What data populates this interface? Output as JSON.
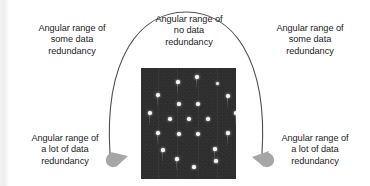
{
  "figure": {
    "background_color": "#ffffff",
    "text_color": "#1b1b1b",
    "arrow_color": "#a6a6a6",
    "arc_color": "#4f4f4f",
    "image_background": "#2b2b2b"
  },
  "captions": {
    "top_left": "Angular range of\nsome data\nredundancy",
    "top_middle": "Angular range of\nno data\nredundancy",
    "top_right": "Angular range of\nsome data\nredundancy",
    "bottom_left": "Angular range of\na lot of data\nredundancy",
    "bottom_right": "Angular range of\na lot of data\nredundancy"
  },
  "arc": {
    "label": "semicircular-scan-arc",
    "left_endpoint": [
      108,
      152
    ],
    "apex": [
      185,
      12
    ],
    "right_endpoint": [
      263,
      152
    ]
  },
  "arrows": {
    "left": {
      "label": "left-arrowhead",
      "x": 112,
      "y": 155
    },
    "right": {
      "label": "right-arrowhead",
      "x": 266,
      "y": 155
    }
  },
  "sinogram": {
    "label": "sinogram-image",
    "x": 141,
    "y": 68,
    "width": 95,
    "height": 111,
    "dots": [
      {
        "x": 37,
        "y": 14,
        "r": 1.6,
        "tail": true
      },
      {
        "x": 56,
        "y": 9,
        "r": 1.7,
        "tail": true
      },
      {
        "x": 76,
        "y": 15,
        "r": 1.5,
        "tail": false
      },
      {
        "x": 17,
        "y": 27,
        "r": 1.7,
        "tail": true
      },
      {
        "x": 87,
        "y": 28,
        "r": 1.7,
        "tail": true
      },
      {
        "x": 38,
        "y": 36,
        "r": 1.7,
        "tail": false
      },
      {
        "x": 57,
        "y": 36,
        "r": 1.7,
        "tail": false
      },
      {
        "x": 9,
        "y": 45,
        "r": 1.7,
        "tail": true
      },
      {
        "x": 95,
        "y": 45,
        "r": 1.6,
        "tail": true
      },
      {
        "x": 29,
        "y": 51,
        "r": 1.7,
        "tail": false
      },
      {
        "x": 48,
        "y": 51,
        "r": 1.7,
        "tail": false
      },
      {
        "x": 67,
        "y": 51,
        "r": 1.7,
        "tail": false
      },
      {
        "x": 17,
        "y": 65,
        "r": 1.7,
        "tail": true
      },
      {
        "x": 87,
        "y": 65,
        "r": 1.6,
        "tail": true
      },
      {
        "x": 38,
        "y": 66,
        "r": 1.7,
        "tail": false
      },
      {
        "x": 57,
        "y": 66,
        "r": 1.7,
        "tail": false
      },
      {
        "x": 22,
        "y": 82,
        "r": 1.6,
        "tail": true
      },
      {
        "x": 74,
        "y": 81,
        "r": 1.6,
        "tail": true
      },
      {
        "x": 36,
        "y": 91,
        "r": 1.6,
        "tail": true
      },
      {
        "x": 75,
        "y": 93,
        "r": 1.6,
        "tail": false
      },
      {
        "x": 53,
        "y": 99,
        "r": 1.6,
        "tail": false
      }
    ]
  }
}
